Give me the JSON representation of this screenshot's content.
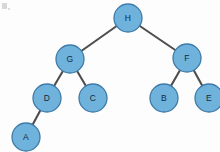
{
  "diagram": {
    "type": "binary-tree",
    "canvas": {
      "width": 220,
      "height": 152
    },
    "node_radius": 14,
    "colors": {
      "node_fill": "#6fb2dc",
      "node_stroke": "#3f7ba8",
      "edge": "#4d4d4d",
      "label": "#132b40",
      "background": "#fdfdfd"
    },
    "nodes": [
      {
        "id": "H",
        "label": "H",
        "cx": 128,
        "cy": 18,
        "r": 14,
        "level": 0
      },
      {
        "id": "G",
        "label": "G",
        "cx": 70,
        "cy": 59,
        "r": 14,
        "level": 1
      },
      {
        "id": "F",
        "label": "F",
        "cx": 187,
        "cy": 58,
        "r": 14,
        "level": 1
      },
      {
        "id": "D",
        "label": "D",
        "cx": 47,
        "cy": 98,
        "r": 14,
        "level": 2
      },
      {
        "id": "C",
        "label": "C",
        "cx": 93,
        "cy": 98,
        "r": 14,
        "level": 2
      },
      {
        "id": "B",
        "label": "B",
        "cx": 164,
        "cy": 98,
        "r": 14,
        "level": 2
      },
      {
        "id": "E",
        "label": "E",
        "cx": 209,
        "cy": 98,
        "r": 14,
        "level": 2
      },
      {
        "id": "A",
        "label": "A",
        "cx": 26,
        "cy": 137,
        "r": 14,
        "level": 3
      }
    ],
    "edges": [
      {
        "from": "H",
        "to": "G",
        "x1": 128,
        "y1": 18,
        "x2": 70,
        "y2": 59
      },
      {
        "from": "H",
        "to": "F",
        "x1": 128,
        "y1": 18,
        "x2": 187,
        "y2": 58
      },
      {
        "from": "G",
        "to": "D",
        "x1": 70,
        "y1": 59,
        "x2": 47,
        "y2": 98
      },
      {
        "from": "G",
        "to": "C",
        "x1": 70,
        "y1": 59,
        "x2": 93,
        "y2": 98
      },
      {
        "from": "D",
        "to": "A",
        "x1": 47,
        "y1": 98,
        "x2": 26,
        "y2": 137
      },
      {
        "from": "F",
        "to": "B",
        "x1": 187,
        "y1": 58,
        "x2": 164,
        "y2": 98
      },
      {
        "from": "F",
        "to": "E",
        "x1": 187,
        "y1": 58,
        "x2": 209,
        "y2": 98
      }
    ]
  }
}
